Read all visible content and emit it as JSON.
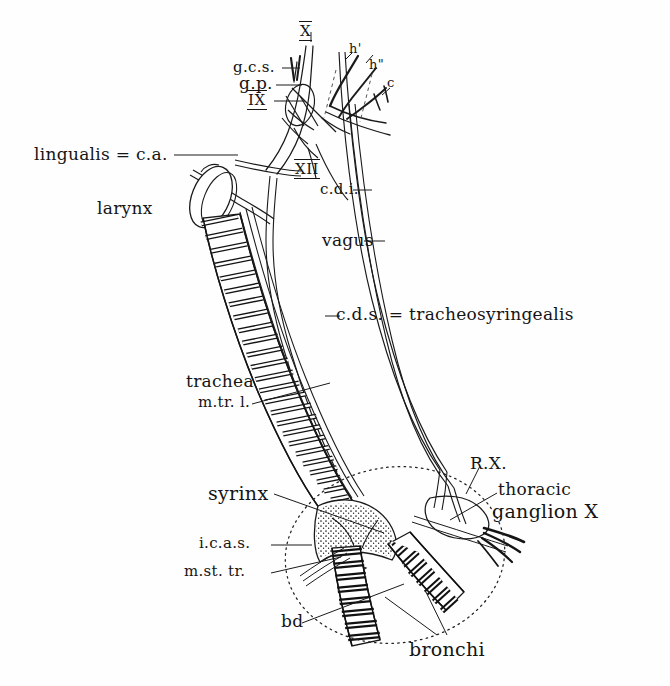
{
  "figure": {
    "background_color": "#fefefe",
    "ink_color": "#151515"
  },
  "labels": {
    "nerve_X_top": "X",
    "g_c_s": "g.c.s.",
    "g_p": "g.p.",
    "nerve_IX": "IX",
    "h_prime": "h'",
    "h_double_prime": "h\"",
    "c_branch": "c",
    "lingualis": "lingualis = c.a.",
    "larynx": "larynx",
    "nerve_XII": "XII",
    "c_d_i": "c.d.i.",
    "vagus": "vagus",
    "c_d_s": "c.d.s. = tracheosyringealis",
    "trachea": "trachea",
    "m_tr_l": "m.tr. l.",
    "syrinx": "syrinx",
    "i_c_a_s": "i.c.a.s.",
    "m_st_tr": "m.st. tr.",
    "r_x": "R.X.",
    "thoracic": "thoracic",
    "ganglion_x": "ganglion X",
    "bd": "bd",
    "bronchi": "bronchi"
  },
  "structures": {
    "trachea_ring_count": 34,
    "bronchus_left_ring_count": 13,
    "bronchus_right_ring_count": 12,
    "syrinx_enclosure": "dotted-ellipse",
    "larynx_shape": "oval-leaf"
  }
}
